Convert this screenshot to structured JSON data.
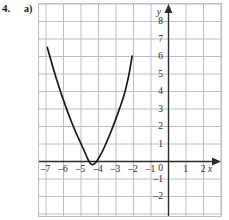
{
  "exercise": {
    "number": "4.",
    "part": "a)"
  },
  "chart_data": {
    "type": "line",
    "title": "",
    "subtitle": "",
    "xlabel": "x",
    "ylabel": "y",
    "xlim": [
      -7.4,
      2.9
    ],
    "ylim": [
      -2.6,
      9.0
    ],
    "grid": true,
    "legend": null,
    "x_ticks": [
      -7,
      -6,
      -5,
      -4,
      -3,
      -2,
      -1,
      1,
      2
    ],
    "x_tick_labels": [
      "–7",
      "–6",
      "–5",
      "–4",
      "–3",
      "–2",
      "–1",
      "1",
      "2"
    ],
    "y_ticks": [
      -2,
      -1,
      1,
      2,
      3,
      4,
      5,
      6,
      7,
      8
    ],
    "y_tick_labels": [
      "–2",
      "–1",
      "1",
      "2",
      "3",
      "4",
      "5",
      "6",
      "7",
      "8"
    ],
    "origin_label": "0",
    "x_axis_arrow": true,
    "y_axis_arrow": true,
    "series": [
      {
        "name": "parabola",
        "type": "curve",
        "color": "#1a1a1a",
        "points": [
          [
            -6.9,
            6.5
          ],
          [
            -6.7,
            5.8
          ],
          [
            -6.5,
            5.1
          ],
          [
            -6.25,
            4.3
          ],
          [
            -6.0,
            3.55
          ],
          [
            -5.75,
            2.85
          ],
          [
            -5.5,
            2.2
          ],
          [
            -5.25,
            1.6
          ],
          [
            -5.0,
            1.05
          ],
          [
            -4.75,
            0.5
          ],
          [
            -4.6,
            0.15
          ],
          [
            -4.5,
            -0.05
          ],
          [
            -4.4,
            -0.18
          ],
          [
            -4.3,
            -0.2
          ],
          [
            -4.2,
            -0.15
          ],
          [
            -4.1,
            -0.05
          ],
          [
            -4.0,
            0.1
          ],
          [
            -3.75,
            0.55
          ],
          [
            -3.5,
            1.1
          ],
          [
            -3.25,
            1.7
          ],
          [
            -3.0,
            2.35
          ],
          [
            -2.75,
            3.05
          ],
          [
            -2.5,
            3.8
          ],
          [
            -2.25,
            4.85
          ],
          [
            -2.05,
            6.0
          ]
        ]
      }
    ]
  },
  "colors": {
    "grid": "#b9bec9",
    "axis": "#2a2a2a",
    "curve": "#1a1a1a",
    "label": "#1f1f1f",
    "background": "#ffffff"
  }
}
